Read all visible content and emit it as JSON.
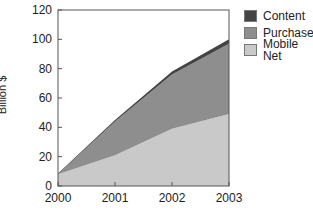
{
  "chart_data": {
    "type": "area",
    "stacked": true,
    "title": "",
    "xlabel": "",
    "ylabel": "Billion $",
    "x": [
      2000,
      2001,
      2002,
      2003
    ],
    "categories": [
      "2000",
      "2001",
      "2002",
      "2003"
    ],
    "ylim": [
      0,
      120
    ],
    "yticks": [
      0,
      20,
      40,
      60,
      80,
      100,
      120
    ],
    "grid": false,
    "legend_position": "right-top",
    "series": [
      {
        "name": "Mobile Net",
        "values": [
          8,
          21,
          39,
          49
        ],
        "color": "#c9c9c9"
      },
      {
        "name": "Purchases",
        "values": [
          0,
          23,
          37,
          48
        ],
        "color": "#8e8e8e"
      },
      {
        "name": "Content",
        "values": [
          0.5,
          1,
          2,
          3
        ],
        "color": "#444444"
      }
    ]
  },
  "legend": {
    "items": [
      {
        "label": "Content",
        "color": "#444444"
      },
      {
        "label": "Purchases",
        "color": "#8e8e8e"
      },
      {
        "label": "Mobile Net",
        "color": "#c9c9c9"
      }
    ]
  },
  "axis": {
    "ylabel": "Billion $"
  }
}
